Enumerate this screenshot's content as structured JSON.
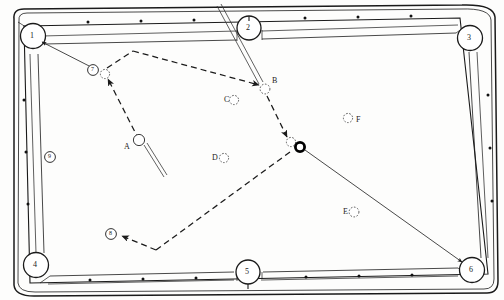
{
  "diagram": {
    "type": "pool-table-shot-plan",
    "table": {
      "surface_color": "#ffffff",
      "line_color": "#1a1a1a",
      "rail_spot_color": "#111111",
      "pockets": [
        {
          "id": "1",
          "label": "1",
          "position": "top-left",
          "cx": 33,
          "cy": 36
        },
        {
          "id": "2",
          "label": "2",
          "position": "top-center",
          "cx": 249,
          "cy": 28
        },
        {
          "id": "3",
          "label": "3",
          "position": "top-right",
          "cx": 470,
          "cy": 38
        },
        {
          "id": "4",
          "label": "4",
          "position": "bottom-left",
          "cx": 36,
          "cy": 265
        },
        {
          "id": "5",
          "label": "5",
          "position": "bottom-center",
          "cx": 248,
          "cy": 272
        },
        {
          "id": "6",
          "label": "6",
          "position": "bottom-right",
          "cx": 472,
          "cy": 270
        }
      ],
      "rail_markers": [
        {
          "label": "7",
          "cx": 93,
          "cy": 70
        },
        {
          "label": "8",
          "cx": 111,
          "cy": 234
        },
        {
          "label": "9",
          "cx": 50,
          "cy": 157
        }
      ]
    },
    "balls": [
      {
        "label": "A",
        "cx": 139,
        "cy": 140,
        "style": "solid-outline",
        "label_side": "left",
        "note": "cue ball being struck"
      },
      {
        "label": "B",
        "cx": 265,
        "cy": 88,
        "style": "ghost-dashed",
        "label_side": "right",
        "note": "contact point on upper path"
      },
      {
        "label": "C",
        "cx": 234,
        "cy": 100,
        "style": "ghost-dashed",
        "label_side": "left",
        "note": "object ball C"
      },
      {
        "label": "D",
        "cx": 224,
        "cy": 158,
        "style": "ghost-dashed",
        "label_side": "left",
        "note": "object ball D"
      },
      {
        "label": "E",
        "cx": 354,
        "cy": 212,
        "style": "ghost-dashed",
        "label_side": "left",
        "note": "object ball E"
      },
      {
        "label": "F",
        "cx": 348,
        "cy": 118,
        "style": "ghost-dashed",
        "label_side": "right",
        "note": "object ball F"
      },
      {
        "label": "",
        "cx": 300,
        "cy": 147,
        "style": "black-target",
        "label_side": "none",
        "note": "target ball potted to pocket 6"
      },
      {
        "label": "",
        "cx": 291,
        "cy": 142,
        "style": "ghost-dashed",
        "label_side": "none",
        "note": "ghost ball at impact"
      },
      {
        "label": "",
        "cx": 105,
        "cy": 74,
        "style": "ghost-dashed",
        "label_side": "none",
        "note": "ghost ball near marker 7"
      }
    ],
    "paths": [
      {
        "name": "dashed-bank-path-upper",
        "style": "dashed",
        "points": "105,74 133,51 265,88"
      },
      {
        "name": "dashed-path-cueball-to-ghost",
        "style": "dashed",
        "points": "139,140 105,74"
      },
      {
        "name": "dashed-path-b-to-target",
        "style": "dashed",
        "points": "265,88 291,142"
      },
      {
        "name": "dashed-path-target-to-bottom-bank",
        "style": "dashed",
        "points": "291,147 155,250 120,236"
      },
      {
        "name": "solid-line-pocket1-to-marker7",
        "style": "solid",
        "points": "38,40 97,70"
      },
      {
        "name": "solid-line-target-to-pocket6",
        "style": "solid",
        "points": "303,148 465,265"
      },
      {
        "name": "cue-stick-lower",
        "style": "cue",
        "points": "144,145 163,175"
      },
      {
        "name": "cue-stick-upper",
        "style": "cue",
        "points": "259,83 217,6"
      }
    ],
    "arrowheads": [
      {
        "target": "ghost-ball-near-7",
        "x": 107,
        "y": 78
      },
      {
        "target": "ball-B",
        "x": 261,
        "y": 85
      },
      {
        "target": "ghost-ball-impact",
        "x": 288,
        "y": 138
      },
      {
        "target": "marker-8",
        "x": 121,
        "y": 235
      },
      {
        "target": "pocket-1",
        "x": 40,
        "y": 42
      },
      {
        "target": "pocket-6",
        "x": 463,
        "y": 263
      }
    ]
  }
}
